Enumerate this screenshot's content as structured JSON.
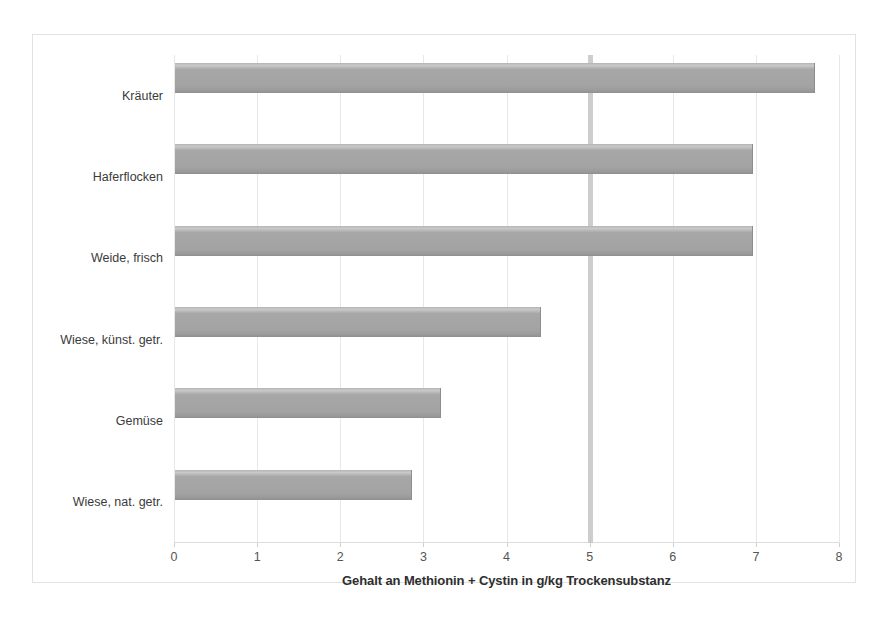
{
  "chart_data": {
    "type": "bar",
    "orientation": "horizontal",
    "title": "",
    "xlabel": "Gehalt an Methionin + Cystin in g/kg Trockensubstanz",
    "ylabel": "",
    "xlim": [
      0,
      8
    ],
    "xticks": [
      "0",
      "1",
      "2",
      "3",
      "4",
      "5",
      "6",
      "7",
      "8"
    ],
    "grid": true,
    "legend": "none",
    "categories": [
      "Kräuter",
      "Haferflocken",
      "Weide, frisch",
      "Wiese, künst. getr.",
      "Gemüse",
      "Wiese, nat. getr."
    ],
    "values": [
      7.7,
      6.95,
      6.95,
      4.4,
      3.2,
      2.85
    ],
    "annotations": [
      {
        "name": "reference-line",
        "type": "vertical-line",
        "x": 5.0
      }
    ],
    "colors": {
      "bar": "#a8a8a8",
      "bar_edge": "#8d8d8d",
      "grid": "#e8e8e8",
      "reference_line": "#c6c6c6",
      "frame": "#e2e2e2",
      "text": "#3b3b3b"
    }
  }
}
